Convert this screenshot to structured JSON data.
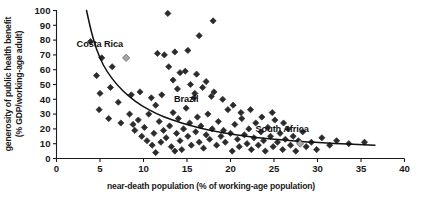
{
  "chart_data": {
    "type": "scatter",
    "title": "",
    "xlabel": "near-death population (% of working-age population)",
    "ylabel_line1": "generosity of public health benefit",
    "ylabel_line2": "(% GDP/working-age adult)",
    "xlim": [
      0,
      40
    ],
    "ylim": [
      0,
      100
    ],
    "xticks": [
      0,
      5,
      10,
      15,
      20,
      25,
      30,
      35,
      40
    ],
    "yticks": [
      0,
      10,
      20,
      30,
      40,
      50,
      60,
      70,
      80,
      90,
      100
    ],
    "grid": false,
    "legend": "none",
    "marker": "diamond",
    "marker_color": "#2b2b2b",
    "highlight_marker_color": "#a8a8a8",
    "trend_line_color": "#111111",
    "annotations": [
      {
        "label": "Costa Rica",
        "x": 8.0,
        "y": 68,
        "label_dx": -26,
        "label_dy": -13
      },
      {
        "label": "Brazil",
        "x": 15.8,
        "y": 38,
        "label_dx": -8,
        "label_dy": -2
      },
      {
        "label": "South Africa",
        "x": 28.0,
        "y": 10,
        "label_dx": -18,
        "label_dy": -14
      }
    ],
    "trend_curve": [
      {
        "x": 3.45,
        "y": 100
      },
      {
        "x": 4.0,
        "y": 86
      },
      {
        "x": 4.6,
        "y": 74
      },
      {
        "x": 5.4,
        "y": 63
      },
      {
        "x": 6.4,
        "y": 54
      },
      {
        "x": 7.6,
        "y": 46
      },
      {
        "x": 9.0,
        "y": 39
      },
      {
        "x": 10.6,
        "y": 33
      },
      {
        "x": 12.4,
        "y": 28
      },
      {
        "x": 14.4,
        "y": 24
      },
      {
        "x": 16.6,
        "y": 20.5
      },
      {
        "x": 19.0,
        "y": 17.5
      },
      {
        "x": 21.6,
        "y": 15.2
      },
      {
        "x": 24.4,
        "y": 13.3
      },
      {
        "x": 27.4,
        "y": 11.8
      },
      {
        "x": 30.6,
        "y": 10.6
      },
      {
        "x": 33.4,
        "y": 9.8
      },
      {
        "x": 36.6,
        "y": 9.0
      }
    ],
    "highlight_points": [
      {
        "x": 8.0,
        "y": 68,
        "name": "Costa Rica"
      },
      {
        "x": 28.0,
        "y": 10,
        "name": "South Africa"
      }
    ],
    "points": [
      {
        "x": 3.9,
        "y": 79
      },
      {
        "x": 5.2,
        "y": 68
      },
      {
        "x": 4.6,
        "y": 56
      },
      {
        "x": 5.0,
        "y": 44
      },
      {
        "x": 4.9,
        "y": 33
      },
      {
        "x": 6.4,
        "y": 62
      },
      {
        "x": 6.2,
        "y": 48
      },
      {
        "x": 6.0,
        "y": 27
      },
      {
        "x": 7.1,
        "y": 38
      },
      {
        "x": 7.4,
        "y": 24
      },
      {
        "x": 8.4,
        "y": 30
      },
      {
        "x": 8.8,
        "y": 23
      },
      {
        "x": 9.0,
        "y": 19
      },
      {
        "x": 9.4,
        "y": 26
      },
      {
        "x": 9.8,
        "y": 15
      },
      {
        "x": 10.1,
        "y": 21
      },
      {
        "x": 10.4,
        "y": 12
      },
      {
        "x": 10.6,
        "y": 30
      },
      {
        "x": 11.0,
        "y": 9
      },
      {
        "x": 11.2,
        "y": 17
      },
      {
        "x": 11.4,
        "y": 4
      },
      {
        "x": 11.8,
        "y": 25
      },
      {
        "x": 12.0,
        "y": 11
      },
      {
        "x": 12.3,
        "y": 19
      },
      {
        "x": 12.6,
        "y": 14
      },
      {
        "x": 13.0,
        "y": 22
      },
      {
        "x": 13.2,
        "y": 8
      },
      {
        "x": 13.4,
        "y": 31
      },
      {
        "x": 13.6,
        "y": 5
      },
      {
        "x": 13.8,
        "y": 17
      },
      {
        "x": 14.0,
        "y": 27
      },
      {
        "x": 14.2,
        "y": 12
      },
      {
        "x": 14.4,
        "y": 6
      },
      {
        "x": 14.6,
        "y": 20
      },
      {
        "x": 14.9,
        "y": 34
      },
      {
        "x": 15.1,
        "y": 15
      },
      {
        "x": 15.3,
        "y": 24
      },
      {
        "x": 15.5,
        "y": 9
      },
      {
        "x": 15.8,
        "y": 41
      },
      {
        "x": 16.0,
        "y": 18
      },
      {
        "x": 16.2,
        "y": 28
      },
      {
        "x": 16.4,
        "y": 11
      },
      {
        "x": 16.6,
        "y": 22
      },
      {
        "x": 16.9,
        "y": 7
      },
      {
        "x": 17.2,
        "y": 16
      },
      {
        "x": 17.4,
        "y": 30
      },
      {
        "x": 17.6,
        "y": 13
      },
      {
        "x": 17.9,
        "y": 20
      },
      {
        "x": 18.1,
        "y": 45
      },
      {
        "x": 18.4,
        "y": 9
      },
      {
        "x": 18.6,
        "y": 25
      },
      {
        "x": 18.9,
        "y": 15
      },
      {
        "x": 19.2,
        "y": 19
      },
      {
        "x": 19.4,
        "y": 11
      },
      {
        "x": 19.7,
        "y": 33
      },
      {
        "x": 20.0,
        "y": 17
      },
      {
        "x": 20.2,
        "y": 5
      },
      {
        "x": 20.5,
        "y": 23
      },
      {
        "x": 20.8,
        "y": 13
      },
      {
        "x": 21.0,
        "y": 8
      },
      {
        "x": 21.3,
        "y": 27
      },
      {
        "x": 21.6,
        "y": 16
      },
      {
        "x": 21.9,
        "y": 10
      },
      {
        "x": 22.1,
        "y": 20
      },
      {
        "x": 22.4,
        "y": 6
      },
      {
        "x": 22.7,
        "y": 14
      },
      {
        "x": 22.9,
        "y": 24
      },
      {
        "x": 23.2,
        "y": 9
      },
      {
        "x": 23.5,
        "y": 18
      },
      {
        "x": 23.8,
        "y": 12
      },
      {
        "x": 24.0,
        "y": 5
      },
      {
        "x": 24.3,
        "y": 21
      },
      {
        "x": 24.6,
        "y": 15
      },
      {
        "x": 24.9,
        "y": 8
      },
      {
        "x": 25.1,
        "y": 26
      },
      {
        "x": 25.4,
        "y": 11
      },
      {
        "x": 25.7,
        "y": 17
      },
      {
        "x": 26.0,
        "y": 6
      },
      {
        "x": 26.3,
        "y": 13
      },
      {
        "x": 26.6,
        "y": 20
      },
      {
        "x": 26.9,
        "y": 9
      },
      {
        "x": 27.2,
        "y": 15
      },
      {
        "x": 27.5,
        "y": 5
      },
      {
        "x": 27.8,
        "y": 12
      },
      {
        "x": 28.3,
        "y": 18
      },
      {
        "x": 28.7,
        "y": 8
      },
      {
        "x": 29.3,
        "y": 11
      },
      {
        "x": 29.9,
        "y": 6
      },
      {
        "x": 30.5,
        "y": 14
      },
      {
        "x": 31.4,
        "y": 9
      },
      {
        "x": 32.2,
        "y": 12
      },
      {
        "x": 33.6,
        "y": 10
      },
      {
        "x": 35.4,
        "y": 11
      },
      {
        "x": 12.8,
        "y": 98
      },
      {
        "x": 18.0,
        "y": 93
      },
      {
        "x": 16.4,
        "y": 83
      },
      {
        "x": 13.6,
        "y": 72
      },
      {
        "x": 15.1,
        "y": 73
      },
      {
        "x": 11.6,
        "y": 71
      },
      {
        "x": 12.4,
        "y": 70
      },
      {
        "x": 12.9,
        "y": 62
      },
      {
        "x": 14.2,
        "y": 58
      },
      {
        "x": 14.8,
        "y": 59
      },
      {
        "x": 16.1,
        "y": 57
      },
      {
        "x": 17.2,
        "y": 52
      },
      {
        "x": 13.4,
        "y": 53
      },
      {
        "x": 13.9,
        "y": 47
      },
      {
        "x": 15.4,
        "y": 50
      },
      {
        "x": 16.8,
        "y": 48
      },
      {
        "x": 15.9,
        "y": 44
      },
      {
        "x": 17.8,
        "y": 42
      },
      {
        "x": 19.1,
        "y": 40
      },
      {
        "x": 20.3,
        "y": 36
      },
      {
        "x": 21.2,
        "y": 31
      },
      {
        "x": 22.3,
        "y": 33
      },
      {
        "x": 23.6,
        "y": 28
      },
      {
        "x": 24.8,
        "y": 31
      },
      {
        "x": 26.1,
        "y": 24
      },
      {
        "x": 10.9,
        "y": 41
      },
      {
        "x": 11.4,
        "y": 36
      },
      {
        "x": 9.6,
        "y": 45
      },
      {
        "x": 8.6,
        "y": 43
      },
      {
        "x": 12.1,
        "y": 43
      }
    ]
  }
}
